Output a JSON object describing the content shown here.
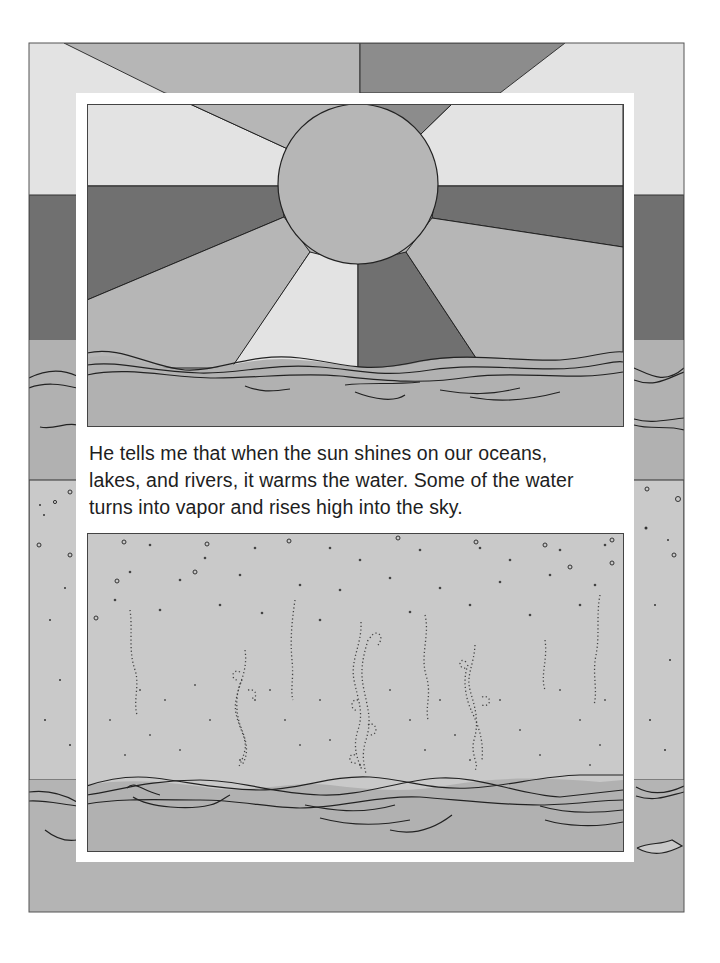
{
  "page": {
    "caption_lines": [
      "He tells me that when the sun shines on our oceans,",
      "lakes, and rivers, it warms the water. Some of the water",
      "turns into vapor and rises high into the sky."
    ]
  },
  "illustration_top": {
    "subject": "sun-over-ocean",
    "elements": [
      "sun",
      "sun-rays",
      "ocean-waves"
    ]
  },
  "illustration_bottom": {
    "subject": "water-vapor-rising",
    "elements": [
      "vapor-droplets",
      "vapor-wisps",
      "ocean-waves"
    ]
  },
  "colors": {
    "light": "#e3e3e3",
    "medium": "#b6b6b6",
    "dark": "#707070",
    "sky": "#c9c9c9",
    "water": "#b1b1b1",
    "line": "#1a1a1a",
    "frame": "#ffffff"
  }
}
